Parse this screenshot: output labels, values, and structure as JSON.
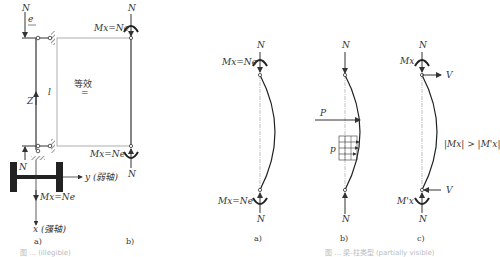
{
  "figure_left": {
    "panel_a": {
      "label": "a)",
      "axial_force": "N",
      "eccentricity": "e",
      "axis_z": "Z",
      "moment_bottom": "Mx=Ne",
      "axis_y": "y (弱轴)",
      "axis_x": "x (强轴)",
      "bottom_reaction": "N"
    },
    "panel_b": {
      "label": "b)",
      "top_force": "N",
      "top_moment": "Mx=Ne",
      "bottom_moment": "Mx=Ne",
      "bottom_force": "N",
      "length": "l",
      "equivalent_text": "等效",
      "equivalent_symbol": "="
    },
    "caption": "图 ... (illegible)"
  },
  "figure_right": {
    "panel_a": {
      "label": "a)",
      "top_force": "N",
      "top_moment": "Mx=Ne",
      "bottom_moment": "Mx=Ne",
      "bottom_force": "N"
    },
    "panel_b": {
      "label": "b)",
      "top_force": "N",
      "point_load": "P",
      "distributed_load": "p",
      "bottom_force": "N"
    },
    "panel_c": {
      "label": "c)",
      "top_force": "N",
      "top_moment": "Mx",
      "top_shear": "V",
      "bottom_moment": "M'x",
      "bottom_shear": "V",
      "bottom_force": "N",
      "relation": "|Mx| > |M'x|"
    },
    "caption": "图 ... 梁-柱类型 (partially visible)"
  }
}
